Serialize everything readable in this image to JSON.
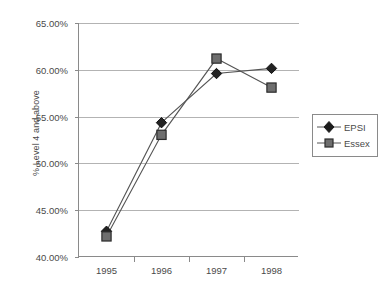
{
  "chart_data": {
    "type": "line",
    "title": "",
    "xlabel": "",
    "ylabel": "% Level 4 and above",
    "categories": [
      "1995",
      "1996",
      "1997",
      "1998"
    ],
    "ylim": [
      40,
      65
    ],
    "ytick_values": [
      65,
      60,
      55,
      50,
      45,
      40
    ],
    "ytick_labels": [
      "65.00%",
      "60.00%",
      "55.00%",
      "50.00%",
      "45.00%",
      "40.00%"
    ],
    "grid": "horizontal",
    "legend_position": "right",
    "series": [
      {
        "name": "EPSI",
        "marker": "diamond",
        "color": "#222222",
        "values": [
          42.75,
          54.35,
          59.6,
          60.15
        ]
      },
      {
        "name": "Essex",
        "marker": "square",
        "color": "#6e6e6e",
        "values": [
          42.2,
          53.05,
          61.2,
          58.1
        ]
      }
    ]
  },
  "axis": {
    "y_title": "% Level 4 and above"
  },
  "legend": {
    "items": [
      {
        "label": "EPSI"
      },
      {
        "label": "Essex"
      }
    ]
  }
}
